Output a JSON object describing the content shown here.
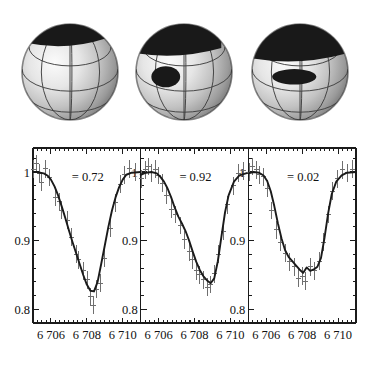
{
  "figure": {
    "kind": "doppler-imaging-figure"
  },
  "spheres": {
    "count": 3,
    "items": [
      {
        "name": "sphere-phase-0.72",
        "spot_label": "dark polar spot",
        "spot_extent": "small cap at top, slight tilt to upper-left"
      },
      {
        "name": "sphere-phase-0.92",
        "spot_label": "dark polar spot",
        "spot_extent": "large cap with appendage extending down the left limb"
      },
      {
        "name": "sphere-phase-0.02",
        "spot_label": "dark polar spot",
        "spot_extent": "broad cap spanning the whole top hemisphere"
      }
    ],
    "grid": {
      "latitudes": 3,
      "longitudes": 3,
      "stroke": "#3a3a3a"
    },
    "surface_colors": {
      "bright": "#f2f2f2",
      "mid": "#b8b8b8",
      "limb": "#6a6a6a",
      "spot": "#171717"
    }
  },
  "chart_data": {
    "type": "line",
    "title": "",
    "panel_count": 3,
    "xlabel": "",
    "ylabel": "",
    "xlim": [
      6705.0,
      6711.0
    ],
    "ylim": [
      0.78,
      1.035
    ],
    "xticks": [
      6706,
      6708,
      6710
    ],
    "xticklabels": [
      "6 706",
      "6 708",
      "6 710"
    ],
    "yticks": [
      1,
      0.9,
      0.8
    ],
    "yticklabels": [
      "1",
      "0.9",
      "0.8"
    ],
    "grid": false,
    "legend": null,
    "panels": [
      {
        "name": "panel-phase-0.72",
        "annotation": "= 0.72",
        "series": [
          {
            "name": "synthetic-profile",
            "x": [
              6705.0,
              6705.2,
              6705.4,
              6705.6,
              6705.8,
              6706.0,
              6706.2,
              6706.4,
              6706.6,
              6706.8,
              6707.0,
              6707.2,
              6707.4,
              6707.6,
              6707.8,
              6708.0,
              6708.2,
              6708.4,
              6708.6,
              6708.8,
              6709.0,
              6709.2,
              6709.4,
              6709.6,
              6709.8,
              6710.0,
              6710.2,
              6710.5,
              6711.0
            ],
            "y": [
              1.0,
              1.0,
              0.999,
              0.998,
              0.995,
              0.989,
              0.979,
              0.966,
              0.95,
              0.933,
              0.915,
              0.898,
              0.882,
              0.866,
              0.85,
              0.836,
              0.827,
              0.826,
              0.84,
              0.866,
              0.893,
              0.92,
              0.944,
              0.963,
              0.978,
              0.989,
              0.996,
              0.999,
              1.0
            ]
          },
          {
            "name": "observed-points",
            "x": [
              6705.05,
              6705.2,
              6705.35,
              6705.5,
              6705.7,
              6705.9,
              6706.25,
              6706.45,
              6706.6,
              6706.9,
              6707.15,
              6707.4,
              6707.55,
              6707.8,
              6708.05,
              6708.2,
              6708.35,
              6708.55,
              6708.75,
              6709.0,
              6709.3,
              6709.6,
              6709.85,
              6710.1,
              6710.4,
              6710.7
            ],
            "y": [
              1.004,
              1.012,
              0.998,
              0.985,
              1.005,
              0.992,
              0.963,
              0.957,
              0.944,
              0.93,
              0.905,
              0.88,
              0.872,
              0.856,
              0.843,
              0.818,
              0.806,
              0.829,
              0.838,
              0.874,
              0.918,
              0.955,
              0.982,
              0.996,
              1.005,
              1.0
            ],
            "xerr": 0.14,
            "yerr": 0.013
          }
        ]
      },
      {
        "name": "panel-phase-0.92",
        "annotation": "= 0.92",
        "series": [
          {
            "name": "synthetic-profile",
            "x": [
              6705.0,
              6705.3,
              6705.6,
              6705.9,
              6706.1,
              6706.3,
              6706.5,
              6706.7,
              6706.9,
              6707.1,
              6707.3,
              6707.5,
              6707.7,
              6707.9,
              6708.1,
              6708.3,
              6708.5,
              6708.7,
              6708.9,
              6709.1,
              6709.3,
              6709.5,
              6709.7,
              6709.9,
              6710.2,
              6710.5,
              6711.0
            ],
            "y": [
              0.996,
              0.999,
              1.0,
              0.998,
              0.993,
              0.986,
              0.976,
              0.963,
              0.948,
              0.935,
              0.925,
              0.914,
              0.9,
              0.884,
              0.869,
              0.857,
              0.848,
              0.842,
              0.838,
              0.845,
              0.87,
              0.906,
              0.941,
              0.966,
              0.986,
              0.995,
              0.999
            ]
          },
          {
            "name": "observed-points",
            "x": [
              6705.05,
              6705.25,
              6705.45,
              6705.6,
              6705.8,
              6706.0,
              6706.2,
              6706.45,
              6706.7,
              6706.95,
              6707.2,
              6707.45,
              6707.7,
              6707.9,
              6708.1,
              6708.3,
              6708.5,
              6708.7,
              6708.9,
              6709.1,
              6709.35,
              6709.6,
              6709.85,
              6710.15,
              6710.45,
              6710.75
            ],
            "y": [
              0.99,
              1.003,
              1.008,
              0.999,
              1.004,
              0.995,
              0.984,
              0.966,
              0.946,
              0.938,
              0.922,
              0.901,
              0.884,
              0.872,
              0.856,
              0.85,
              0.843,
              0.832,
              0.836,
              0.852,
              0.88,
              0.914,
              0.952,
              0.98,
              0.998,
              1.002
            ],
            "xerr": 0.14,
            "yerr": 0.013
          }
        ]
      },
      {
        "name": "panel-phase-0.02",
        "annotation": "= 0.02",
        "series": [
          {
            "name": "synthetic-profile",
            "x": [
              6705.0,
              6705.3,
              6705.6,
              6705.85,
              6706.05,
              6706.25,
              6706.45,
              6706.65,
              6706.85,
              6707.05,
              6707.25,
              6707.45,
              6707.65,
              6707.85,
              6708.05,
              6708.25,
              6708.45,
              6708.65,
              6708.85,
              6709.05,
              6709.25,
              6709.45,
              6709.65,
              6709.9,
              6710.2,
              6710.5,
              6711.0
            ],
            "y": [
              0.998,
              1.0,
              0.999,
              0.995,
              0.987,
              0.972,
              0.95,
              0.925,
              0.903,
              0.886,
              0.876,
              0.87,
              0.864,
              0.858,
              0.853,
              0.861,
              0.856,
              0.858,
              0.862,
              0.875,
              0.905,
              0.94,
              0.968,
              0.986,
              0.995,
              0.999,
              1.0
            ]
          },
          {
            "name": "observed-points",
            "x": [
              6705.05,
              6705.25,
              6705.45,
              6705.65,
              6705.85,
              6706.05,
              6706.3,
              6706.55,
              6706.8,
              6707.05,
              6707.3,
              6707.55,
              6707.8,
              6708.0,
              6708.2,
              6708.45,
              6708.7,
              6708.95,
              6709.2,
              6709.45,
              6709.7,
              6709.95,
              6710.25,
              6710.55,
              6710.8
            ],
            "y": [
              1.0,
              1.008,
              1.003,
              0.996,
              0.993,
              0.976,
              0.944,
              0.916,
              0.898,
              0.882,
              0.869,
              0.862,
              0.845,
              0.848,
              0.841,
              0.862,
              0.856,
              0.87,
              0.898,
              0.938,
              0.972,
              0.99,
              1.003,
              0.999,
              1.004
            ],
            "xerr": 0.14,
            "yerr": 0.013
          }
        ]
      }
    ]
  }
}
